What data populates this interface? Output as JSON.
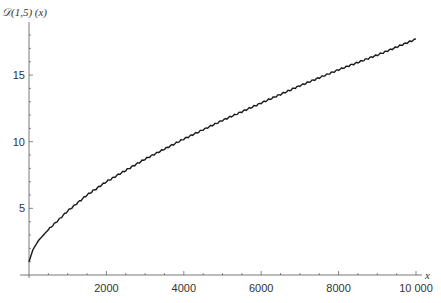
{
  "chart_data": {
    "type": "line",
    "title": "",
    "ylabel": "𝒟(1,5) (x)",
    "xlabel": "x",
    "xlim": [
      0,
      10000
    ],
    "ylim": [
      0,
      18
    ],
    "grid": false,
    "legend": null,
    "x_ticks": [
      2000,
      4000,
      6000,
      8000,
      10000
    ],
    "x_tick_labels": [
      "2000",
      "4000",
      "6000",
      "8000",
      "10 000"
    ],
    "y_ticks": [
      5,
      10,
      15
    ],
    "y_tick_labels": [
      "5",
      "10",
      "15"
    ],
    "series": [
      {
        "name": "D(1,5)(x)",
        "color": "#1a1a1a",
        "x": [
          0,
          100,
          250,
          500,
          1000,
          1500,
          2000,
          3000,
          4000,
          5000,
          6000,
          7000,
          8000,
          9000,
          10000
        ],
        "values": [
          1.0,
          1.9,
          2.6,
          3.4,
          4.8,
          6.0,
          7.0,
          8.7,
          10.2,
          11.6,
          12.9,
          14.2,
          15.4,
          16.5,
          17.7
        ]
      }
    ]
  }
}
